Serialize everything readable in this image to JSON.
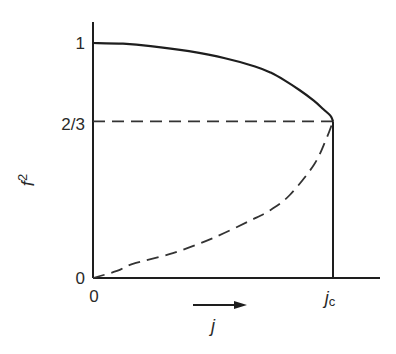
{
  "chart_data": {
    "type": "line",
    "title": "",
    "xlabel": "j",
    "ylabel": "f²",
    "ylabel_sup": "2",
    "ylabel_base": "f",
    "xlabel_arrow": true,
    "grid": false,
    "legend": null,
    "xlim": [
      0,
      1.15
    ],
    "ylim": [
      0,
      1.1
    ],
    "x_ticks": [
      {
        "value": 0,
        "label": "0"
      },
      {
        "value": 1,
        "label": "j",
        "subscript": "c"
      }
    ],
    "y_ticks": [
      {
        "value": 0,
        "label": "0"
      },
      {
        "value": 0.6667,
        "label": "2/3"
      },
      {
        "value": 1,
        "label": "1"
      }
    ],
    "x_unit_note": "x expressed as j/jc",
    "series": [
      {
        "name": "stable branch (upper)",
        "style": "solid",
        "x": [
          0.0,
          0.125,
          0.24,
          0.4,
          0.55,
          0.675,
          0.74,
          0.8,
          0.86,
          0.92,
          0.96,
          0.99,
          1.0
        ],
        "y": [
          1.0,
          0.997,
          0.987,
          0.965,
          0.935,
          0.9,
          0.874,
          0.84,
          0.8,
          0.755,
          0.718,
          0.69,
          0.6667
        ]
      },
      {
        "name": "unstable branch (lower)",
        "style": "dashed",
        "x": [
          0.0,
          0.1,
          0.166,
          0.333,
          0.5,
          0.66,
          0.74,
          0.82,
          0.92,
          0.97,
          1.0
        ],
        "y": [
          0.0,
          0.03,
          0.06,
          0.106,
          0.17,
          0.247,
          0.29,
          0.353,
          0.481,
          0.587,
          0.6667
        ]
      },
      {
        "name": "f² = 2/3 reference",
        "style": "dashed",
        "x": [
          0.0,
          1.0
        ],
        "y": [
          0.6667,
          0.6667
        ]
      },
      {
        "name": "j = jc vertical",
        "style": "solid",
        "x": [
          1.0,
          1.0
        ],
        "y": [
          0.0,
          0.6667
        ]
      }
    ],
    "annotations": [
      {
        "type": "arrow",
        "direction": "right",
        "label": "j",
        "position": "below x-axis"
      }
    ]
  },
  "labels": {
    "y_tick_1": "1",
    "y_tick_23": "2/3",
    "y_tick_0": "0",
    "x_tick_0": "0",
    "x_tick_jc_base": "j",
    "x_tick_jc_sub": "c",
    "x_axis_label": "j",
    "y_axis_label_base": "f",
    "y_axis_label_sup": "2"
  },
  "colors": {
    "ink": "#1e1e1e",
    "dashed": "#333333",
    "background": "#ffffff"
  }
}
